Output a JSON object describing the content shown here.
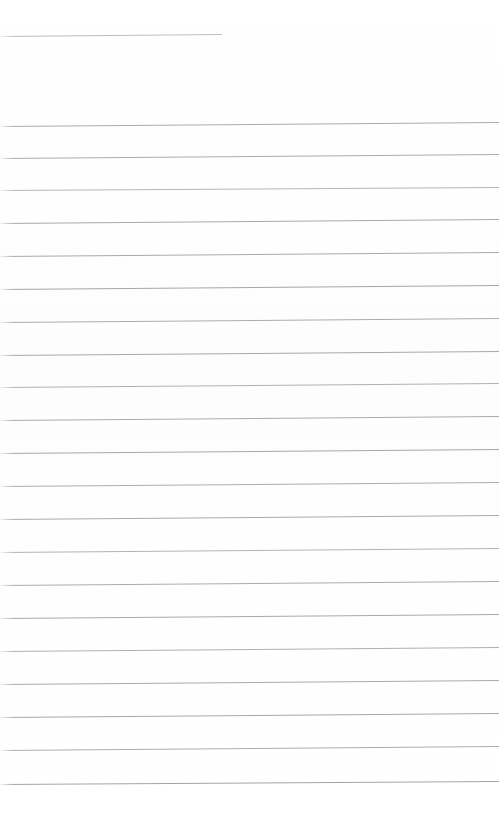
{
  "page": {
    "width": 499,
    "height": 814,
    "background_color": "#fefefe",
    "content_text": ""
  },
  "rules": {
    "ink_color": "#b2b5b8",
    "ink_color_dark": "#9a9da0",
    "ink_color_light": "#c9ccce",
    "header": {
      "label": "header-rule",
      "x_start": 0,
      "x_end": 222,
      "y_left": 36,
      "y_right": 34,
      "thickness": 1,
      "color": "#bcbfc2"
    },
    "body": [
      {
        "label": "rule-1",
        "y_left": 126,
        "y_right": 122,
        "color": "#a9acaf",
        "thickness": 1
      },
      {
        "label": "rule-2",
        "y_left": 158,
        "y_right": 154,
        "color": "#aaadb0",
        "thickness": 1
      },
      {
        "label": "rule-3",
        "y_left": 190,
        "y_right": 187,
        "color": "#b4b7ba",
        "thickness": 1
      },
      {
        "label": "rule-4",
        "y_left": 223,
        "y_right": 219,
        "color": "#a5a8ab",
        "thickness": 1
      },
      {
        "label": "rule-5",
        "y_left": 256,
        "y_right": 252,
        "color": "#a7aaad",
        "thickness": 1
      },
      {
        "label": "rule-6",
        "y_left": 289,
        "y_right": 285,
        "color": "#a4a7aa",
        "thickness": 1
      },
      {
        "label": "rule-7",
        "y_left": 322,
        "y_right": 318,
        "color": "#a9acaf",
        "thickness": 1
      },
      {
        "label": "rule-8",
        "y_left": 355,
        "y_right": 351,
        "color": "#a6a9ac",
        "thickness": 1
      },
      {
        "label": "rule-9",
        "y_left": 387,
        "y_right": 383,
        "color": "#aeb1b4",
        "thickness": 1
      },
      {
        "label": "rule-10",
        "y_left": 420,
        "y_right": 416,
        "color": "#a8abae",
        "thickness": 1
      },
      {
        "label": "rule-11",
        "y_left": 453,
        "y_right": 449,
        "color": "#a5a8ab",
        "thickness": 1
      },
      {
        "label": "rule-12",
        "y_left": 486,
        "y_right": 482,
        "color": "#abaeb1",
        "thickness": 1
      },
      {
        "label": "rule-13",
        "y_left": 519,
        "y_right": 515,
        "color": "#a7aaad",
        "thickness": 1
      },
      {
        "label": "rule-14",
        "y_left": 552,
        "y_right": 548,
        "color": "#b0b3b6",
        "thickness": 1
      },
      {
        "label": "rule-15",
        "y_left": 585,
        "y_right": 581,
        "color": "#a9acaf",
        "thickness": 1
      },
      {
        "label": "rule-16",
        "y_left": 618,
        "y_right": 614,
        "color": "#a6a9ac",
        "thickness": 1
      },
      {
        "label": "rule-17",
        "y_left": 651,
        "y_right": 647,
        "color": "#adb0b3",
        "thickness": 1
      },
      {
        "label": "rule-18",
        "y_left": 684,
        "y_right": 680,
        "color": "#a8abae",
        "thickness": 1
      },
      {
        "label": "rule-19",
        "y_left": 717,
        "y_right": 713,
        "color": "#a4a7aa",
        "thickness": 1
      },
      {
        "label": "rule-20",
        "y_left": 750,
        "y_right": 746,
        "color": "#aaadb0",
        "thickness": 1
      },
      {
        "label": "rule-21",
        "y_left": 784,
        "y_right": 781,
        "color": "#a2a5a8",
        "thickness": 1
      }
    ]
  }
}
